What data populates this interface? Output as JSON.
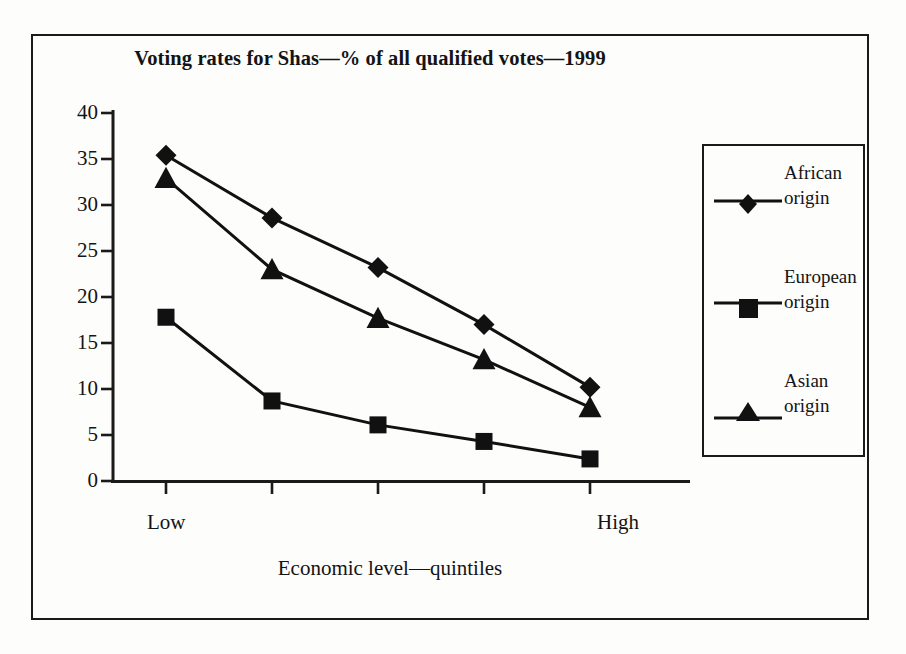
{
  "chart_data": {
    "type": "line",
    "title": "Voting rates for Shas—% of all qualified votes—1999",
    "xlabel": "Economic level—quintiles",
    "ylabel": "",
    "categories": [
      "1",
      "2",
      "3",
      "4",
      "5"
    ],
    "x_tick_labels": [
      "Low",
      "",
      "",
      "",
      "High"
    ],
    "x_axis_endpoint_labels": {
      "left": "Low",
      "right": "High"
    },
    "y_tick_labels": [
      "0",
      "5",
      "10",
      "15",
      "20",
      "25",
      "30",
      "35",
      "40"
    ],
    "y_ticks": [
      0,
      5,
      10,
      15,
      20,
      25,
      30,
      35,
      40
    ],
    "ylim": [
      0,
      40
    ],
    "grid": false,
    "legend_position": "right",
    "series": [
      {
        "name": "African origin",
        "legend_line_1": "African",
        "legend_line_2": "origin",
        "marker": "diamond",
        "color": "#111111",
        "values": [
          35.4,
          28.6,
          23.2,
          17.0,
          10.2
        ]
      },
      {
        "name": "European origin",
        "legend_line_1": "European",
        "legend_line_2": "origin",
        "marker": "square",
        "color": "#111111",
        "values": [
          17.8,
          8.7,
          6.1,
          4.3,
          2.4
        ]
      },
      {
        "name": "Asian origin",
        "legend_line_1": "Asian",
        "legend_line_2": "origin",
        "marker": "triangle",
        "color": "#111111",
        "values": [
          32.9,
          23.0,
          17.7,
          13.2,
          8.0
        ]
      }
    ]
  },
  "figure": {
    "frame_color": "#1a1a1a",
    "background": "#fdfdfc",
    "text_color": "#141414"
  }
}
